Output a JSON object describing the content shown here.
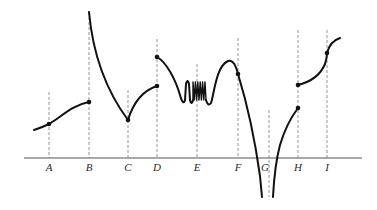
{
  "diagram": {
    "type": "function-graph",
    "axis": {
      "x_start": 24,
      "x_end": 362,
      "y": 158
    },
    "points": [
      {
        "label": "A",
        "x": 49
      },
      {
        "label": "B",
        "x": 89
      },
      {
        "label": "C",
        "x": 128
      },
      {
        "label": "D",
        "x": 157
      },
      {
        "label": "E",
        "x": 197
      },
      {
        "label": "F",
        "x": 238
      },
      {
        "label": "G",
        "x": 269
      },
      {
        "label": "H",
        "x": 298
      },
      {
        "label": "I",
        "x": 327
      }
    ],
    "colors": {
      "curve": "#111111",
      "guide": "#7a7a7a",
      "axis": "#555555"
    }
  }
}
